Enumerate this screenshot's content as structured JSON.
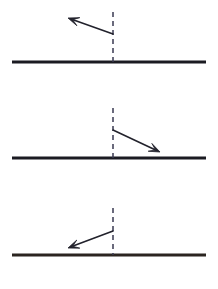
{
  "figure": {
    "width": 218,
    "height": 289,
    "background_color": "#ffffff"
  },
  "style": {
    "surface_color": "#1b1b22",
    "surface_color_warm": "#3a2f28",
    "normal_color": "#3a3a52",
    "arrow_color": "#22222c",
    "surface_thickness": 3.2,
    "normal_thickness": 1.5,
    "arrow_thickness": 1.6,
    "dash_pattern": "5,4"
  },
  "chart_data": {
    "type": "diagram",
    "xlabel": "",
    "ylabel": "",
    "xlim": [
      0,
      218
    ],
    "ylim": [
      0,
      289
    ],
    "grid": false,
    "legend": false,
    "panels": [
      {
        "id": "panel-1",
        "index": 1,
        "label": "top",
        "surface": {
          "x1": 12,
          "y1": 62,
          "x2": 206,
          "y2": 62,
          "color": "#1b1b22"
        },
        "normal": {
          "x": 113,
          "y_top": 12,
          "y_bottom": 62,
          "color": "#3a3a52",
          "dashed": true
        },
        "arrow": {
          "tail_x": 113,
          "tail_y": 34,
          "tip_x": 68,
          "tip_y": 18,
          "direction": "up-left",
          "angle_deg": 160,
          "head": "barbed"
        }
      },
      {
        "id": "panel-2",
        "index": 2,
        "label": "middle",
        "surface": {
          "x1": 12,
          "y1": 158,
          "x2": 206,
          "y2": 158,
          "color": "#1b1b22"
        },
        "normal": {
          "x": 113,
          "y_top": 108,
          "y_bottom": 158,
          "color": "#3a3a52",
          "dashed": true
        },
        "arrow": {
          "tail_x": 113,
          "tail_y": 130,
          "tip_x": 160,
          "tip_y": 152,
          "direction": "down-right",
          "angle_deg": -25,
          "head": "barbed"
        }
      },
      {
        "id": "panel-3",
        "index": 3,
        "label": "bottom",
        "surface": {
          "x1": 12,
          "y1": 255,
          "x2": 206,
          "y2": 255,
          "color": "#2b2520"
        },
        "normal": {
          "x": 113,
          "y_top": 208,
          "y_bottom": 255,
          "color": "#3a3a52",
          "dashed": true
        },
        "arrow": {
          "tail_x": 113,
          "tail_y": 231,
          "tip_x": 68,
          "tip_y": 248,
          "direction": "down-left",
          "angle_deg": 200,
          "head": "barbed"
        }
      }
    ]
  }
}
